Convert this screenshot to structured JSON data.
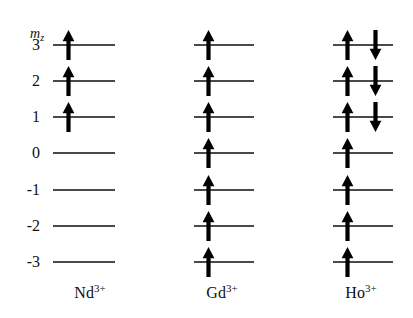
{
  "figure": {
    "axis_label_base": "m",
    "axis_label_sub": "z",
    "line_color": "#4a4a4a",
    "arrow_color": "#000000",
    "background": "#ffffff"
  },
  "levels": [
    {
      "label": "3",
      "mz": 3,
      "y": 45
    },
    {
      "label": "2",
      "mz": 2,
      "y": 81
    },
    {
      "label": "1",
      "mz": 1,
      "y": 117
    },
    {
      "label": "0",
      "mz": 0,
      "y": 153
    },
    {
      "label": "-1",
      "mz": -1,
      "y": 190
    },
    {
      "label": "-2",
      "mz": -2,
      "y": 226
    },
    {
      "label": "-3",
      "mz": -3,
      "y": 262
    }
  ],
  "columns": [
    {
      "id": "nd",
      "element": "Nd",
      "charge": "3+",
      "caption_text": "Nd",
      "caption_sup": "3+",
      "line_left": 53,
      "line_width": 62,
      "caption_center": 90,
      "up_arrow_x": 62,
      "down_arrow_x": 90,
      "occupancy": [
        {
          "mz": 3,
          "up": true,
          "down": false
        },
        {
          "mz": 2,
          "up": true,
          "down": false
        },
        {
          "mz": 1,
          "up": true,
          "down": false
        },
        {
          "mz": 0,
          "up": false,
          "down": false
        },
        {
          "mz": -1,
          "up": false,
          "down": false
        },
        {
          "mz": -2,
          "up": false,
          "down": false
        },
        {
          "mz": -3,
          "up": false,
          "down": false
        }
      ]
    },
    {
      "id": "gd",
      "element": "Gd",
      "charge": "3+",
      "caption_text": "Gd",
      "caption_sup": "3+",
      "line_left": 194,
      "line_width": 60,
      "caption_center": 222,
      "up_arrow_x": 202,
      "down_arrow_x": 230,
      "occupancy": [
        {
          "mz": 3,
          "up": true,
          "down": false
        },
        {
          "mz": 2,
          "up": true,
          "down": false
        },
        {
          "mz": 1,
          "up": true,
          "down": false
        },
        {
          "mz": 0,
          "up": true,
          "down": false
        },
        {
          "mz": -1,
          "up": true,
          "down": false
        },
        {
          "mz": -2,
          "up": true,
          "down": false
        },
        {
          "mz": -3,
          "up": true,
          "down": false
        }
      ]
    },
    {
      "id": "ho",
      "element": "Ho",
      "charge": "3+",
      "caption_text": "Ho",
      "caption_sup": "3+",
      "line_left": 333,
      "line_width": 60,
      "caption_center": 361,
      "up_arrow_x": 341,
      "down_arrow_x": 369,
      "occupancy": [
        {
          "mz": 3,
          "up": true,
          "down": true
        },
        {
          "mz": 2,
          "up": true,
          "down": true
        },
        {
          "mz": 1,
          "up": true,
          "down": true
        },
        {
          "mz": 0,
          "up": true,
          "down": false
        },
        {
          "mz": -1,
          "up": true,
          "down": false
        },
        {
          "mz": -2,
          "up": true,
          "down": false
        },
        {
          "mz": -3,
          "up": true,
          "down": false
        }
      ]
    }
  ]
}
